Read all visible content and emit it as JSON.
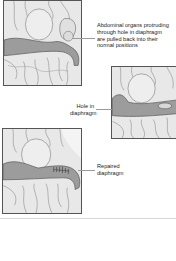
{
  "diagram": {
    "panels": [
      {
        "id": "panel-1",
        "description": "Abdominal organs protruding through diaphragm hole",
        "label_lines": [
          "Abdominal organs protruding",
          "through hole in diaphragm",
          "are pulled back into their",
          "normal positions"
        ]
      },
      {
        "id": "panel-2",
        "description": "Diaphragm with hole",
        "label_lines": [
          "Hole in",
          "diaphragm"
        ]
      },
      {
        "id": "panel-3",
        "description": "Diaphragm after repair with sutures",
        "label_lines": [
          "Repaired",
          "diaphragm"
        ]
      }
    ],
    "colors": {
      "background": "#ffffff",
      "organ_fill": "#e6e6e6",
      "diaphragm_band": "#9c9c9c",
      "outline": "#555555",
      "leader_line": "#9a9a9a",
      "text": "#222222"
    }
  }
}
